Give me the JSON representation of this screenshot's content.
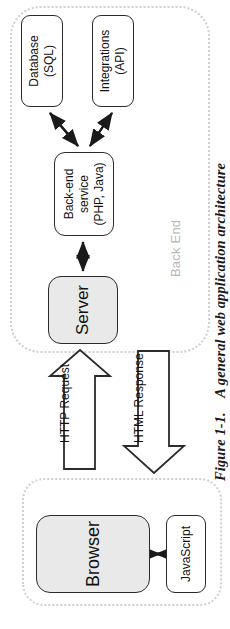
{
  "figure": {
    "caption_label": "Figure 1-1.",
    "caption_text": "A general web application architecture",
    "caption_full": "Figure 1-1.  A general web application architecture"
  },
  "groups": [
    {
      "id": "front-end",
      "label": "Front End"
    },
    {
      "id": "back-end",
      "label": "Back End"
    }
  ],
  "nodes": {
    "browser": {
      "label": "Browser",
      "fill": "#e9e9e9",
      "stroke": "#2b2b2b"
    },
    "javascript": {
      "label": "JavaScript",
      "fill": "#ffffff",
      "stroke": "#2b2b2b"
    },
    "server": {
      "label": "Server",
      "fill": "#e9e9e9",
      "stroke": "#2b2b2b"
    },
    "backend_service": {
      "label": "Back-end service\n(PHP, Java)",
      "fill": "#ffffff",
      "stroke": "#2b2b2b"
    },
    "database": {
      "label": "Database (SQL)",
      "fill": "#ffffff",
      "stroke": "#2b2b2b"
    },
    "integrations": {
      "label": "Integrations (API)",
      "fill": "#ffffff",
      "stroke": "#2b2b2b"
    }
  },
  "connectors": {
    "http_request": {
      "label": "HTTP Request",
      "direction": "browser-to-server",
      "style": "block-arrow"
    },
    "html_response": {
      "label": "HTML Response",
      "direction": "server-to-browser",
      "style": "block-arrow"
    },
    "browser_javascript": {
      "label": "",
      "direction": "bidirectional",
      "style": "line-arrow"
    },
    "server_backend": {
      "label": "",
      "direction": "bidirectional",
      "style": "line-arrow"
    },
    "backend_database": {
      "label": "",
      "direction": "bidirectional",
      "style": "line-arrow"
    },
    "backend_integrations": {
      "label": "",
      "direction": "bidirectional",
      "style": "line-arrow"
    }
  },
  "colors": {
    "group_border": "#cfcfcf",
    "group_label": "#b8b8b8",
    "node_stroke": "#2b2b2b",
    "node_fill_shaded": "#e9e9e9",
    "node_fill_plain": "#ffffff",
    "arrow": "#1a1a1a",
    "background": "#ffffff"
  }
}
